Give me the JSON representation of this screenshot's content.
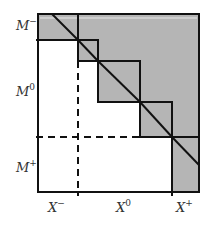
{
  "diagram": {
    "colors": {
      "fill": "#b5b5b5",
      "stroke": "#111111",
      "background": "#ffffff"
    },
    "row_labels": [
      {
        "base": "M",
        "sup": "−"
      },
      {
        "base": "M",
        "sup": "0"
      },
      {
        "base": "M",
        "sup": "+"
      }
    ],
    "col_labels": [
      {
        "base": "X",
        "sup": "−"
      },
      {
        "base": "X",
        "sup": "0"
      },
      {
        "base": "X",
        "sup": "+"
      }
    ],
    "diagonal_block_count": 5
  }
}
